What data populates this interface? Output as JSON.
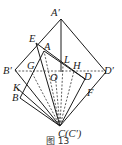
{
  "figure": {
    "caption": "图 13",
    "labels": {
      "A_prime": "A′",
      "E": "E",
      "A": "A",
      "L": "L",
      "B_prime": "B′",
      "G": "G",
      "O": "O",
      "H": "H",
      "D": "D",
      "D_prime": "D′",
      "K": "K",
      "B": "B",
      "F": "F",
      "C": "C(C′)"
    }
  }
}
